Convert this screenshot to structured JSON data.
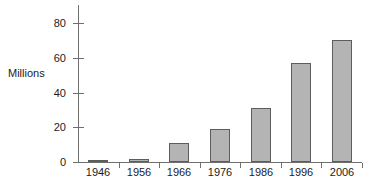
{
  "chart_data": {
    "type": "bar",
    "title": "",
    "subtitle": "",
    "xlabel": "",
    "ylabel": "Millions",
    "categories": [
      "1946",
      "1956",
      "1966",
      "1976",
      "1986",
      "1996",
      "2006"
    ],
    "values": [
      0.5,
      2,
      11,
      19,
      31,
      57,
      70
    ],
    "series": [
      {
        "name": "Millions",
        "values": [
          0.5,
          2,
          11,
          19,
          31,
          57,
          70
        ]
      }
    ],
    "ylim": [
      0,
      80
    ],
    "yticks": [
      0,
      20,
      40,
      60,
      80
    ],
    "ytick_labels": [
      "0",
      "20",
      "40",
      "60",
      "80"
    ],
    "xtick_labels": [
      "1946",
      "1956",
      "1966",
      "1976",
      "1986",
      "1996",
      "2006"
    ],
    "grid": false,
    "legend": false,
    "legend_position": "none",
    "bar_fill_color": "#b4b4b4",
    "bar_border_color": "#5d5d5d",
    "axis_color": "#6f6f6f",
    "text_color": "#1c1c1c",
    "background_color": "#ffffff"
  }
}
